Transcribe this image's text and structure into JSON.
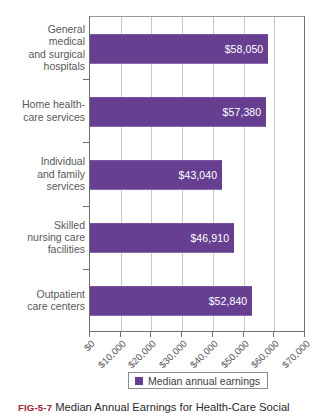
{
  "chart_data": {
    "type": "bar",
    "orientation": "horizontal",
    "title": "",
    "xlabel": "",
    "ylabel": "",
    "xlim": [
      0,
      70000
    ],
    "grid": true,
    "legend_position": "bottom",
    "categories": [
      "General\nmedical\nand surgical\nhospitals",
      "Home health-\ncare services",
      "Individual\nand family\nservices",
      "Skilled\nnursing care\nfacilities",
      "Outpatient\ncare centers"
    ],
    "values": [
      58050,
      57380,
      43040,
      46910,
      52840
    ],
    "value_labels": [
      "$58,050",
      "$57,380",
      "$43,040",
      "$46,910",
      "$52,840"
    ],
    "xticks": [
      0,
      10000,
      20000,
      30000,
      40000,
      50000,
      60000,
      70000
    ],
    "xtick_labels": [
      "$0",
      "$10,000",
      "$20,000",
      "$30,000",
      "$40,000",
      "$50,000",
      "$60,000",
      "$70,000"
    ],
    "series": [
      {
        "name": "Median annual earnings",
        "color": "#663f91",
        "values": [
          58050,
          57380,
          43040,
          46910,
          52840
        ]
      }
    ]
  },
  "legend": {
    "label": "Median annual earnings",
    "color": "#663f91"
  },
  "caption": {
    "figure_number": "FIG-5-7",
    "text": "Median Annual Earnings for Health-Care Social"
  }
}
